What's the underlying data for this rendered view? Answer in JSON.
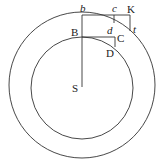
{
  "diagram": {
    "colors": {
      "stroke": "#333333",
      "text": "#222222",
      "background": "#ffffff"
    },
    "circles": [
      {
        "name": "outer-orbit",
        "cx": 82,
        "cy": 82,
        "r": 74
      },
      {
        "name": "inner-orbit",
        "cx": 82,
        "cy": 87,
        "r": 50
      }
    ],
    "labels": {
      "b": "b",
      "c": "c",
      "K": "K",
      "B": "B",
      "d": "d",
      "C": "C",
      "t": "t",
      "D": "D",
      "S": "S"
    }
  }
}
